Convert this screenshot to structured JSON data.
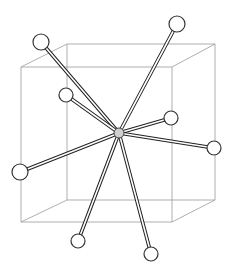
{
  "diagram": {
    "type": "coordination-polyhedron",
    "colors": {
      "background": "#ffffff",
      "cube_edge": "#9a9a9a",
      "bond": "#222222",
      "atom_fill": "#ffffff",
      "atom_stroke": "#333333",
      "center_atom_fill": "#cfcfcf"
    },
    "cube": {
      "front": [
        [
          21,
          67
        ],
        [
          172,
          67
        ],
        [
          172,
          222
        ],
        [
          21,
          222
        ]
      ],
      "back": [
        [
          67,
          44
        ],
        [
          215,
          44
        ],
        [
          215,
          200
        ],
        [
          67,
          200
        ]
      ]
    },
    "center_atom": {
      "x": 119,
      "y": 133,
      "r": 5
    },
    "neighbor_atoms": [
      {
        "id": "n1",
        "x": 41,
        "y": 42,
        "r": 8
      },
      {
        "id": "n2",
        "x": 177,
        "y": 24,
        "r": 8
      },
      {
        "id": "n3",
        "x": 66,
        "y": 95,
        "r": 7
      },
      {
        "id": "n4",
        "x": 171,
        "y": 118,
        "r": 7
      },
      {
        "id": "n5",
        "x": 214,
        "y": 148,
        "r": 7
      },
      {
        "id": "n6",
        "x": 20,
        "y": 172,
        "r": 8
      },
      {
        "id": "n7",
        "x": 78,
        "y": 241,
        "r": 7
      },
      {
        "id": "n8",
        "x": 151,
        "y": 254,
        "r": 7
      }
    ]
  }
}
